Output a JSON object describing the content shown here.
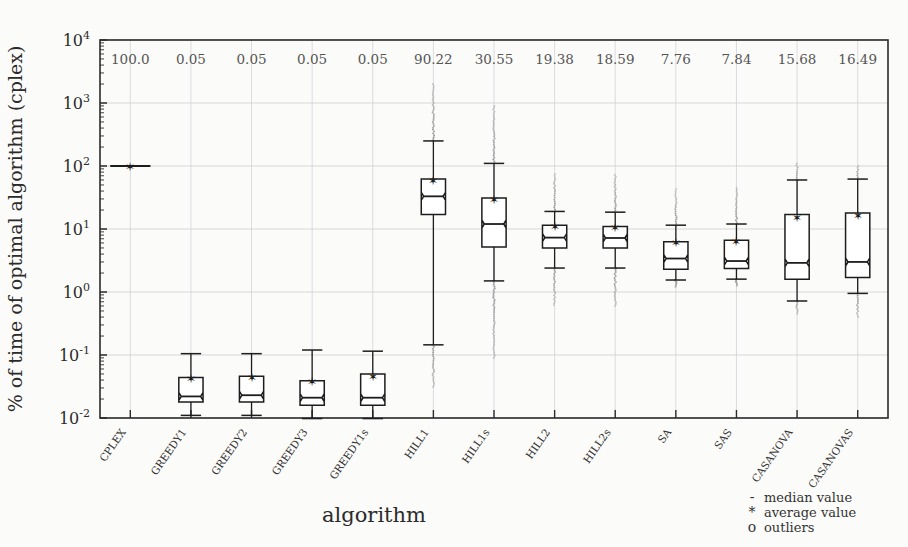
{
  "chart_data": {
    "type": "box",
    "title": "",
    "xlabel": "algorithm",
    "ylabel": "% of time of optimal algorithm (cplex)",
    "yscale": "log",
    "ylim": [
      0.01,
      10000
    ],
    "ytick_labels": [
      "10^4",
      "10^3",
      "10^2",
      "10^1",
      "10^0",
      "10^-1",
      "10^-2"
    ],
    "ytick_values": [
      10000,
      1000,
      100,
      10,
      1,
      0.1,
      0.01
    ],
    "grid": true,
    "legend_position": "bottom-right",
    "categories": [
      "CPLEX",
      "GREEDY1",
      "GREEDY2",
      "GREEDY3",
      "GREEDY1s",
      "HILL1",
      "HILL1s",
      "HILL2",
      "HILL2s",
      "SA",
      "SAS",
      "CASANOVA",
      "CASANOVAS"
    ],
    "top_annotation_label": "average value",
    "top_annotations": [
      "100.0",
      "0.05",
      "0.05",
      "0.05",
      "0.05",
      "90.22",
      "30.55",
      "19.38",
      "18.59",
      "7.76",
      "7.84",
      "15.68",
      "16.49"
    ],
    "boxes": [
      {
        "name": "CPLEX",
        "min": 100,
        "q1": 100,
        "median": 100,
        "q3": 100,
        "max": 100,
        "mean": 100,
        "outlier_top": 100,
        "outlier_bottom": 100,
        "flat": true
      },
      {
        "name": "GREEDY1",
        "min": 0.011,
        "q1": 0.018,
        "median": 0.022,
        "q3": 0.044,
        "max": 0.105,
        "mean": 0.05,
        "outlier_top": 0.105,
        "outlier_bottom": 0.011,
        "flat": false
      },
      {
        "name": "GREEDY2",
        "min": 0.011,
        "q1": 0.018,
        "median": 0.023,
        "q3": 0.046,
        "max": 0.105,
        "mean": 0.05,
        "outlier_top": 0.105,
        "outlier_bottom": 0.011,
        "flat": false
      },
      {
        "name": "GREEDY3",
        "min": 0.0098,
        "q1": 0.016,
        "median": 0.021,
        "q3": 0.039,
        "max": 0.12,
        "mean": 0.045,
        "outlier_top": 0.12,
        "outlier_bottom": 0.0098,
        "flat": false
      },
      {
        "name": "GREEDY1s",
        "min": 0.0098,
        "q1": 0.016,
        "median": 0.021,
        "q3": 0.05,
        "max": 0.115,
        "mean": 0.047,
        "outlier_top": 0.115,
        "outlier_bottom": 0.0098,
        "flat": false
      },
      {
        "name": "HILL1",
        "min": 0.145,
        "q1": 17,
        "median": 33,
        "q3": 62,
        "max": 250,
        "mean": 90.22,
        "outlier_top": 2000,
        "outlier_bottom": 0.031,
        "flat": false
      },
      {
        "name": "HILL1s",
        "min": 1.5,
        "q1": 5.2,
        "median": 12,
        "q3": 31,
        "max": 110,
        "mean": 30.55,
        "outlier_top": 900,
        "outlier_bottom": 0.09,
        "flat": false
      },
      {
        "name": "HILL2",
        "min": 2.4,
        "q1": 5.0,
        "median": 7.3,
        "q3": 11.5,
        "max": 19,
        "mean": 19.38,
        "outlier_top": 75,
        "outlier_bottom": 0.62,
        "flat": false
      },
      {
        "name": "HILL2s",
        "min": 2.4,
        "q1": 5.0,
        "median": 7.2,
        "q3": 11.0,
        "max": 18.5,
        "mean": 18.59,
        "outlier_top": 72,
        "outlier_bottom": 0.6,
        "flat": false
      },
      {
        "name": "SA",
        "min": 1.55,
        "q1": 2.3,
        "median": 3.4,
        "q3": 6.3,
        "max": 11.5,
        "mean": 7.76,
        "outlier_top": 43,
        "outlier_bottom": 1.2,
        "flat": false
      },
      {
        "name": "SAS",
        "min": 1.6,
        "q1": 2.35,
        "median": 3.1,
        "q3": 6.6,
        "max": 12,
        "mean": 7.84,
        "outlier_top": 45,
        "outlier_bottom": 1.25,
        "flat": false
      },
      {
        "name": "CASANOVA",
        "min": 0.72,
        "q1": 1.6,
        "median": 2.9,
        "q3": 17,
        "max": 60,
        "mean": 15.68,
        "outlier_top": 110,
        "outlier_bottom": 0.45,
        "flat": false
      },
      {
        "name": "CASANOVAS",
        "min": 0.95,
        "q1": 1.7,
        "median": 3.0,
        "q3": 18,
        "max": 62,
        "mean": 16.49,
        "outlier_top": 100,
        "outlier_bottom": 0.4,
        "flat": false
      }
    ],
    "legend": [
      {
        "marker": "-",
        "label": "median value"
      },
      {
        "marker": "*",
        "label": "average value"
      },
      {
        "marker": "o",
        "label": "outliers"
      }
    ]
  },
  "colors": {
    "axis": "#2b2b2b",
    "box_stroke": "#1d1d1d",
    "grid": "#cfcfd4",
    "outlier": "#9a9a9a",
    "background": "#fbfbf9"
  }
}
